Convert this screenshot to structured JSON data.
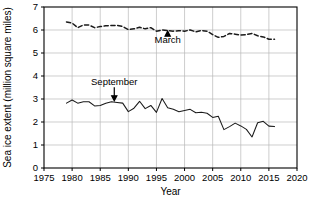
{
  "chart_data": {
    "type": "line",
    "title": "",
    "xlabel": "Year",
    "ylabel": "Sea ice extent (million square miles)",
    "xlim": [
      1975,
      2020
    ],
    "ylim": [
      0,
      7
    ],
    "xticks": [
      1975,
      1980,
      1985,
      1990,
      1995,
      2000,
      2005,
      2010,
      2015,
      2020
    ],
    "yticks": [
      0,
      1,
      2,
      3,
      4,
      5,
      6,
      7
    ],
    "grid": true,
    "legend": "none",
    "annotations": [
      {
        "label": "March",
        "x": 1997,
        "y": 5.45,
        "arrow": "up",
        "points_to_y": 5.95
      },
      {
        "label": "September",
        "x": 1987.5,
        "y": 3.62,
        "arrow": "down",
        "points_to_y": 2.88
      }
    ],
    "series": [
      {
        "name": "March",
        "style": "dashed",
        "x": [
          1979,
          1980,
          1981,
          1982,
          1983,
          1984,
          1985,
          1986,
          1987,
          1988,
          1989,
          1990,
          1991,
          1992,
          1993,
          1994,
          1995,
          1996,
          1997,
          1998,
          1999,
          2000,
          2001,
          2002,
          2003,
          2004,
          2005,
          2006,
          2007,
          2008,
          2009,
          2010,
          2011,
          2012,
          2013,
          2014,
          2015,
          2016
        ],
        "values": [
          6.35,
          6.3,
          6.1,
          6.22,
          6.22,
          6.1,
          6.15,
          6.18,
          6.2,
          6.2,
          6.15,
          6.02,
          6.05,
          6.12,
          6.05,
          6.1,
          5.95,
          6.0,
          5.98,
          5.95,
          5.97,
          5.95,
          6.0,
          5.92,
          5.98,
          5.95,
          5.8,
          5.68,
          5.72,
          5.85,
          5.82,
          5.78,
          5.8,
          5.85,
          5.75,
          5.7,
          5.6,
          5.6
        ]
      },
      {
        "name": "September",
        "style": "solid",
        "x": [
          1979,
          1980,
          1981,
          1982,
          1983,
          1984,
          1985,
          1986,
          1987,
          1988,
          1989,
          1990,
          1991,
          1992,
          1993,
          1994,
          1995,
          1996,
          1997,
          1998,
          1999,
          2000,
          2001,
          2002,
          2003,
          2004,
          2005,
          2006,
          2007,
          2008,
          2009,
          2010,
          2011,
          2012,
          2013,
          2014,
          2015,
          2016
        ],
        "values": [
          2.82,
          2.96,
          2.82,
          2.88,
          2.88,
          2.7,
          2.72,
          2.82,
          2.88,
          2.85,
          2.82,
          2.45,
          2.6,
          2.9,
          2.58,
          2.72,
          2.42,
          3.02,
          2.62,
          2.55,
          2.45,
          2.5,
          2.55,
          2.4,
          2.42,
          2.38,
          2.2,
          2.25,
          1.67,
          1.8,
          1.95,
          1.83,
          1.68,
          1.35,
          1.97,
          2.03,
          1.82,
          1.8
        ]
      }
    ]
  }
}
